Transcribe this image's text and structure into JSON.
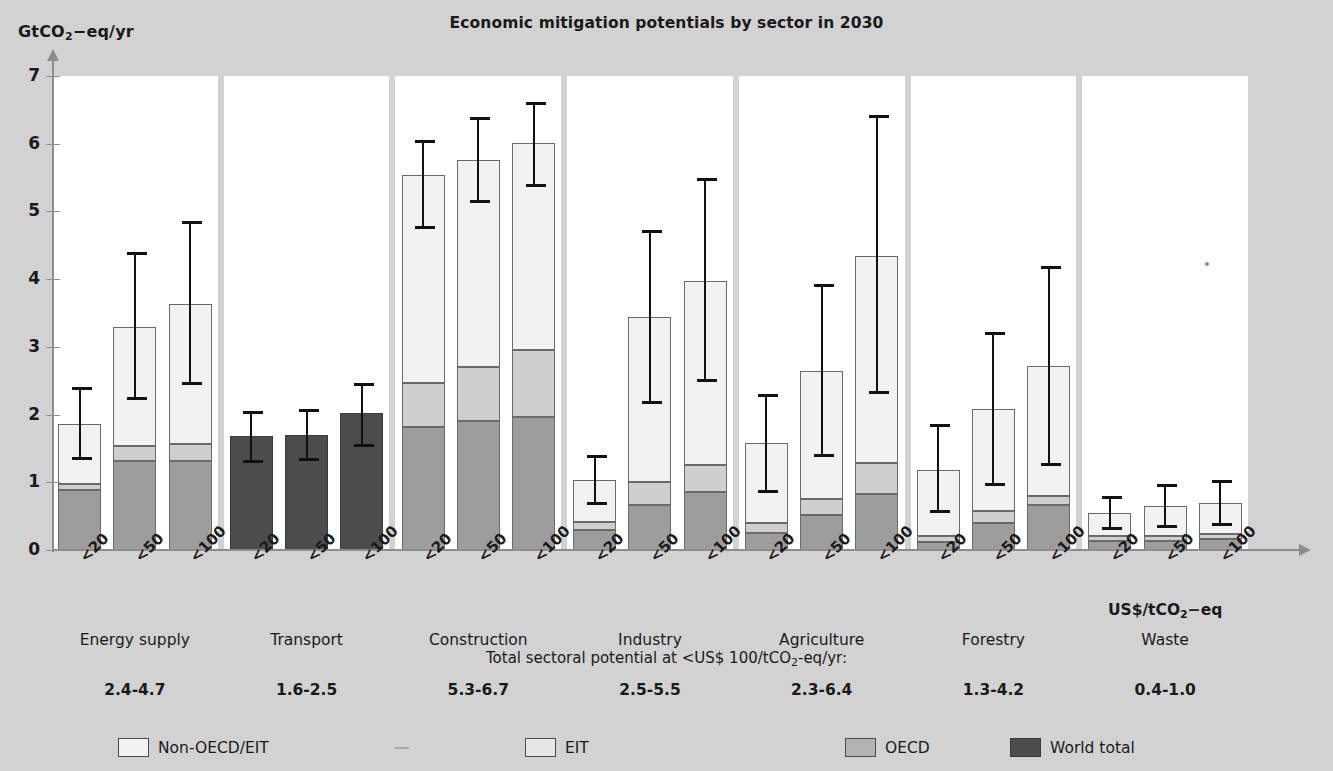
{
  "axis": {
    "y_label_html": "GtCO2-eq/yr",
    "y_ticks": [
      "0",
      "1",
      "2",
      "3",
      "4",
      "5",
      "6",
      "7"
    ],
    "x_unit_html": "US$/tCO2-eq",
    "x_tick_labels": [
      "<20",
      "<50",
      "<100"
    ]
  },
  "title": "Economic mitigation potentials by sector in 2030",
  "total_caption": "Total sectoral potential at <US$ 100/tCO2-eq/yr:",
  "legend": [
    {
      "key": "nonoecd",
      "label": "Non-OECD/EIT",
      "color": "#f2f2f2"
    },
    {
      "key": "eit",
      "label": "EIT",
      "color": "#e6e6e6"
    },
    {
      "key": "oecd",
      "label": "OECD",
      "color": "#b3b3b3"
    },
    {
      "key": "world",
      "label": "World total",
      "color": "#4c4c4c"
    }
  ],
  "chart_data": {
    "type": "bar",
    "title": "Economic mitigation potentials by sector in 2030",
    "xlabel": "US$/tCO2-eq",
    "ylabel": "GtCO2-eq/yr",
    "ylim": [
      0,
      7
    ],
    "grid": false,
    "legend_position": "bottom",
    "stacking": "stacked (OECD + EIT + Non-OECD/EIT); Transport shown as World total only",
    "categories": [
      "<20",
      "<50",
      "<100"
    ],
    "sectors": [
      {
        "name": "Energy supply",
        "total_range": "2.4-4.7",
        "bars": [
          {
            "price": "<20",
            "oecd": 0.88,
            "eit": 0.1,
            "nonoecd": 0.88,
            "total": 1.86,
            "err_low": 1.33,
            "err_high": 2.4,
            "style": "stacked"
          },
          {
            "price": "<50",
            "oecd": 1.32,
            "eit": 0.22,
            "nonoecd": 1.76,
            "total": 3.3,
            "err_low": 2.22,
            "err_high": 4.4,
            "style": "stacked"
          },
          {
            "price": "<100",
            "oecd": 1.32,
            "eit": 0.24,
            "nonoecd": 2.08,
            "total": 3.64,
            "err_low": 2.44,
            "err_high": 4.86,
            "style": "stacked"
          }
        ]
      },
      {
        "name": "Transport",
        "total_range": "1.6-2.5",
        "bars": [
          {
            "price": "<20",
            "world": 1.68,
            "total": 1.68,
            "err_low": 1.28,
            "err_high": 2.06,
            "style": "world"
          },
          {
            "price": "<50",
            "world": 1.7,
            "total": 1.7,
            "err_low": 1.32,
            "err_high": 2.08,
            "style": "world"
          },
          {
            "price": "<100",
            "world": 2.02,
            "total": 2.02,
            "err_low": 1.52,
            "err_high": 2.46,
            "style": "world"
          }
        ]
      },
      {
        "name": "Construction",
        "total_range": "5.3-6.7",
        "bars": [
          {
            "price": "<20",
            "oecd": 1.82,
            "eit": 0.64,
            "nonoecd": 3.08,
            "total": 5.54,
            "err_low": 4.74,
            "err_high": 6.06,
            "style": "stacked"
          },
          {
            "price": "<50",
            "oecd": 1.9,
            "eit": 0.8,
            "nonoecd": 3.06,
            "total": 5.76,
            "err_low": 5.12,
            "err_high": 6.4,
            "style": "stacked"
          },
          {
            "price": "<100",
            "oecd": 1.96,
            "eit": 0.99,
            "nonoecd": 3.06,
            "total": 6.01,
            "err_low": 5.36,
            "err_high": 6.62,
            "style": "stacked"
          }
        ]
      },
      {
        "name": "Industry",
        "total_range": "2.5-5.5",
        "bars": [
          {
            "price": "<20",
            "oecd": 0.3,
            "eit": 0.12,
            "nonoecd": 0.62,
            "total": 1.04,
            "err_low": 0.66,
            "err_high": 1.4,
            "style": "stacked"
          },
          {
            "price": "<50",
            "oecd": 0.66,
            "eit": 0.34,
            "nonoecd": 2.44,
            "total": 3.44,
            "err_low": 2.16,
            "err_high": 4.72,
            "style": "stacked"
          },
          {
            "price": "<100",
            "oecd": 0.85,
            "eit": 0.4,
            "nonoecd": 2.73,
            "total": 3.98,
            "err_low": 2.48,
            "err_high": 5.5,
            "style": "stacked"
          }
        ]
      },
      {
        "name": "Agriculture",
        "total_range": "2.3-6.4",
        "bars": [
          {
            "price": "<20",
            "oecd": 0.25,
            "eit": 0.15,
            "nonoecd": 1.18,
            "total": 1.58,
            "err_low": 0.84,
            "err_high": 2.3,
            "style": "stacked"
          },
          {
            "price": "<50",
            "oecd": 0.52,
            "eit": 0.23,
            "nonoecd": 1.9,
            "total": 2.65,
            "err_low": 1.38,
            "err_high": 3.93,
            "style": "stacked"
          },
          {
            "price": "<100",
            "oecd": 0.82,
            "eit": 0.46,
            "nonoecd": 3.06,
            "total": 4.34,
            "err_low": 2.3,
            "err_high": 6.42,
            "style": "stacked"
          }
        ]
      },
      {
        "name": "Forestry",
        "total_range": "1.3-4.2",
        "bars": [
          {
            "price": "<20",
            "oecd": 0.12,
            "eit": 0.08,
            "nonoecd": 0.98,
            "total": 1.18,
            "err_low": 0.54,
            "err_high": 1.86,
            "style": "stacked"
          },
          {
            "price": "<50",
            "oecd": 0.4,
            "eit": 0.18,
            "nonoecd": 1.5,
            "total": 2.08,
            "err_low": 0.95,
            "err_high": 3.22,
            "style": "stacked"
          },
          {
            "price": "<100",
            "oecd": 0.66,
            "eit": 0.14,
            "nonoecd": 1.92,
            "total": 2.72,
            "err_low": 1.24,
            "err_high": 4.2,
            "style": "stacked"
          }
        ]
      },
      {
        "name": "Waste",
        "total_range": "0.4-1.0",
        "bars": [
          {
            "price": "<20",
            "oecd": 0.14,
            "eit": 0.06,
            "nonoecd": 0.34,
            "total": 0.54,
            "err_low": 0.3,
            "err_high": 0.8,
            "style": "stacked"
          },
          {
            "price": "<50",
            "oecd": 0.14,
            "eit": 0.07,
            "nonoecd": 0.44,
            "total": 0.65,
            "err_low": 0.33,
            "err_high": 0.97,
            "style": "stacked"
          },
          {
            "price": "<100",
            "oecd": 0.16,
            "eit": 0.08,
            "nonoecd": 0.46,
            "total": 0.7,
            "err_low": 0.36,
            "err_high": 1.04,
            "style": "stacked"
          }
        ]
      }
    ]
  }
}
